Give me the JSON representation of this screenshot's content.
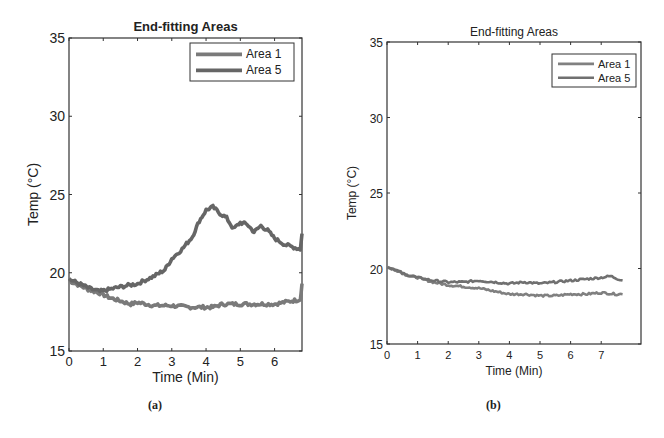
{
  "chart_data": [
    {
      "type": "line",
      "panel": "a",
      "caption": "(a)",
      "title": "End-fitting Areas",
      "xlabel": "Time (Min)",
      "ylabel": "Temp (°C)",
      "xlim": [
        0,
        6.8
      ],
      "ylim": [
        15,
        35
      ],
      "xticks": [
        0,
        1,
        2,
        3,
        4,
        5,
        6
      ],
      "yticks": [
        15,
        20,
        25,
        30,
        35
      ],
      "grid": false,
      "legend_position": "upper right",
      "series": [
        {
          "name": "Area 1",
          "color": "#7a7a7a",
          "x": [
            0,
            0.3,
            0.6,
            0.9,
            1.2,
            1.5,
            1.8,
            2.0,
            2.5,
            3.0,
            3.5,
            4.0,
            4.2,
            4.5,
            5.0,
            5.5,
            6.0,
            6.5,
            6.75,
            6.8
          ],
          "y": [
            19.5,
            19.2,
            18.9,
            18.7,
            18.4,
            18.2,
            18.0,
            18.1,
            17.9,
            17.9,
            17.8,
            17.8,
            17.8,
            18.0,
            18.0,
            18.0,
            18.0,
            18.2,
            18.3,
            19.3
          ]
        },
        {
          "name": "Area 5",
          "color": "#666666",
          "x": [
            0,
            0.3,
            0.6,
            0.9,
            1.1,
            1.5,
            2.0,
            2.5,
            2.8,
            3.0,
            3.3,
            3.6,
            3.8,
            4.0,
            4.2,
            4.4,
            4.6,
            4.8,
            5.0,
            5.2,
            5.4,
            5.6,
            5.8,
            6.0,
            6.3,
            6.6,
            6.75,
            6.8
          ],
          "y": [
            19.6,
            19.3,
            19.0,
            18.8,
            18.9,
            19.1,
            19.3,
            19.8,
            20.2,
            20.9,
            21.5,
            22.3,
            23.3,
            24.0,
            24.2,
            23.8,
            23.5,
            22.8,
            23.2,
            23.1,
            22.6,
            23.0,
            22.7,
            22.2,
            21.8,
            21.6,
            21.5,
            22.5
          ]
        }
      ]
    },
    {
      "type": "line",
      "panel": "b",
      "caption": "(b)",
      "title": "End-fitting Areas",
      "xlabel": "Time (Min)",
      "ylabel": "Temp (°C)",
      "xlim": [
        0,
        8.3
      ],
      "ylim": [
        15,
        35
      ],
      "xticks": [
        0,
        1,
        2,
        3,
        4,
        5,
        6,
        7
      ],
      "yticks": [
        15,
        20,
        25,
        30,
        35
      ],
      "grid": false,
      "legend_position": "upper right",
      "series": [
        {
          "name": "Area 1",
          "color": "#808080",
          "x": [
            0,
            0.3,
            0.6,
            1.0,
            1.5,
            2.0,
            2.5,
            3.0,
            3.5,
            4.0,
            4.5,
            5.0,
            5.5,
            6.0,
            6.5,
            7.0,
            7.5,
            7.7
          ],
          "y": [
            20.1,
            19.9,
            19.6,
            19.4,
            19.1,
            18.9,
            18.8,
            18.7,
            18.5,
            18.3,
            18.3,
            18.2,
            18.2,
            18.3,
            18.3,
            18.4,
            18.3,
            18.3
          ]
        },
        {
          "name": "Area 5",
          "color": "#707070",
          "x": [
            0,
            0.3,
            0.6,
            1.0,
            1.5,
            2.0,
            2.5,
            3.0,
            3.5,
            4.0,
            4.5,
            5.0,
            5.5,
            6.0,
            6.5,
            7.0,
            7.3,
            7.7
          ],
          "y": [
            20.1,
            19.9,
            19.6,
            19.4,
            19.2,
            19.1,
            19.1,
            19.2,
            19.1,
            19.0,
            19.1,
            19.0,
            19.1,
            19.2,
            19.3,
            19.4,
            19.5,
            19.2
          ]
        }
      ]
    }
  ]
}
